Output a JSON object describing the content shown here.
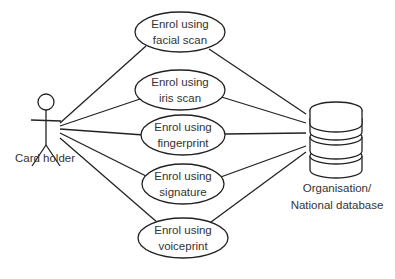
{
  "diagram": {
    "type": "use-case",
    "actors": [
      {
        "id": "card-holder",
        "label": "Card holder"
      },
      {
        "id": "database",
        "label_line1": "Organisation/",
        "label_line2": "National database"
      }
    ],
    "use_cases": [
      {
        "id": "facial",
        "line1": "Enrol using",
        "line2": "facial scan"
      },
      {
        "id": "iris",
        "line1": "Enrol using",
        "line2": "iris scan"
      },
      {
        "id": "fingerprint",
        "line1": "Enrol using",
        "line2": "fingerprint"
      },
      {
        "id": "signature",
        "line1": "Enrol using",
        "line2": "signature"
      },
      {
        "id": "voiceprint",
        "line1": "Enrol using",
        "line2": "voiceprint"
      }
    ],
    "colors": {
      "stroke": "#222222",
      "text": "#333333",
      "background": "#ffffff"
    }
  }
}
